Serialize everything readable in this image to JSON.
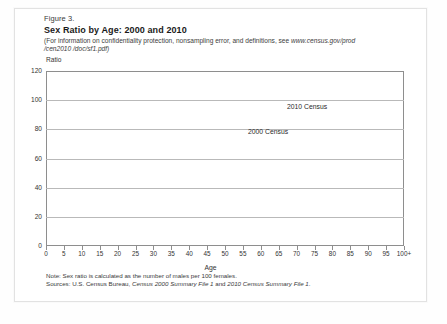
{
  "figure": {
    "number": "Figure 3.",
    "title": "Sex Ratio by Age: 2000 and 2010",
    "subtitle_line1": "(For information on confidentiality protection, nonsampling error, and definitions, see ",
    "subtitle_url1": "www.census.gov/prod",
    "subtitle_url2": "/cen2010 /doc/sf1.pdf)"
  },
  "notes": {
    "note": "Note: Sex ratio is calculated as the number of males per 100 females.",
    "sources_prefix": "Sources: U.S. Census Bureau, ",
    "sources_italic1": "Census 2000 Summary File 1",
    "sources_mid": " and ",
    "sources_italic2": "2010 Census Summary File 1",
    "sources_end": "."
  },
  "colors": {
    "series_2000": "#6e6e6e",
    "series_2010": "#555555",
    "gridline": "#b9b9b9",
    "axis": "#8e8e8e",
    "text": "#2c2c2c"
  },
  "chart_data": {
    "type": "line",
    "title": "Sex Ratio by Age: 2000 and 2010",
    "xlabel": "Age",
    "ylabel": "Ratio",
    "ylim": [
      0,
      120
    ],
    "yticks": [
      0,
      20,
      40,
      60,
      80,
      100,
      120
    ],
    "xlim": [
      0,
      100
    ],
    "xticks": [
      0,
      5,
      10,
      15,
      20,
      25,
      30,
      35,
      40,
      45,
      50,
      55,
      60,
      65,
      70,
      75,
      80,
      85,
      90,
      95,
      100
    ],
    "xticklabels": [
      "0",
      "5",
      "10",
      "15",
      "20",
      "25",
      "30",
      "35",
      "40",
      "45",
      "50",
      "55",
      "60",
      "65",
      "70",
      "75",
      "80",
      "85",
      "90",
      "95",
      "100+"
    ],
    "grid": true,
    "legend": "inline-annotations",
    "annotations": [
      {
        "text": "2010 Census",
        "x": 72,
        "y": 88
      },
      {
        "text": "2000 Census",
        "x": 60,
        "y": 73
      }
    ],
    "x": [
      0,
      5,
      10,
      15,
      20,
      25,
      30,
      35,
      40,
      45,
      50,
      55,
      60,
      65,
      70,
      75,
      80,
      85,
      90,
      95,
      100
    ],
    "series": [
      {
        "name": "2000 Census",
        "values": [
          104.8,
          104.6,
          104.5,
          105.6,
          104.3,
          103.0,
          101.5,
          100.2,
          99.0,
          97.8,
          95.8,
          92.7,
          88.0,
          81.8,
          73.8,
          64.0,
          52.5,
          41.0,
          31.0,
          25.5,
          23.0
        ]
      },
      {
        "name": "2010 Census",
        "values": [
          104.9,
          104.7,
          104.6,
          105.4,
          104.9,
          103.4,
          102.0,
          100.8,
          99.6,
          98.6,
          97.0,
          94.8,
          91.5,
          87.0,
          80.8,
          72.5,
          61.5,
          48.5,
          36.0,
          28.0,
          24.5
        ]
      }
    ]
  }
}
